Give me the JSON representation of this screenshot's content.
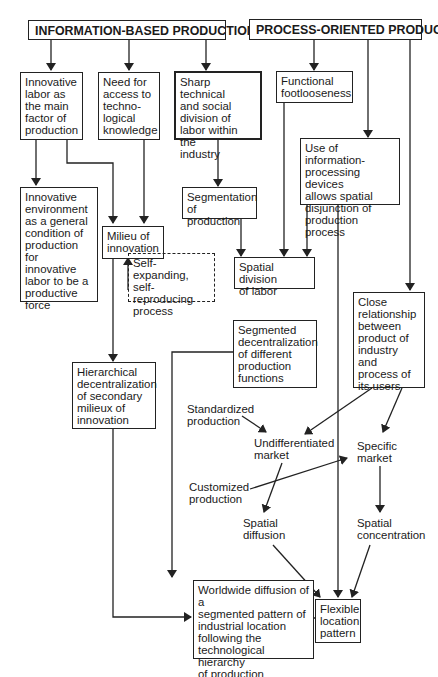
{
  "headers": {
    "info": "INFORMATION-BASED PRODUCTION",
    "process": "PROCESS-ORIENTED PRODUCT"
  },
  "boxes": {
    "innovative_labor": "Innovative\nlabor as\nthe main\nfactor of\nproduction",
    "need_access": "Need for\naccess to\ntechno-\nlogical\nknowledge",
    "sharp_division": "Sharp technical\nand social\ndivision of\nlabor within the\nindustry",
    "functional_footloose": "Functional\nfootlooseness",
    "info_devices": "Use of information-\nprocessing devices\nallows spatial\ndisjunction of\nproduction process",
    "innovative_env": "Innovative\nenvironment\nas a general\ncondition of\nproduction for\ninnovative\nlabor to be a\nproductive\nforce",
    "milieu": "Milieu of\ninnovation",
    "self_expanding": "Self-expanding,\nself-reproducing\nprocess",
    "segmentation": "Segmentation\nof production",
    "spatial_division": "Spatial division\nof  labor",
    "close_relationship": "Close\nrelationship\nbetween\nproduct of\nindustry and\nprocess of\nits users",
    "segmented_decentral": "Segmented\ndecentralization\nof different\nproduction\nfunctions",
    "hierarchical": "Hierarchical\ndecentralization\nof secondary\nmilieux of\ninnovation",
    "worldwide": "Worldwide diffusion of a\nsegmented pattern of\nindustrial location\nfollowing the\ntechnological hierarchy\nof production functions",
    "flexible": "Flexible\nlocation\npattern"
  },
  "labels": {
    "standardized": "Standardized\nproduction",
    "undifferentiated": "Undifferentiated\nmarket",
    "specific": "Specific\nmarket",
    "customized": "Customized\nproduction",
    "spatial_diffusion": "Spatial\ndiffusion",
    "spatial_concentration": "Spatial\nconcentration"
  },
  "colors": {
    "line": "#222222",
    "background": "#ffffff"
  }
}
